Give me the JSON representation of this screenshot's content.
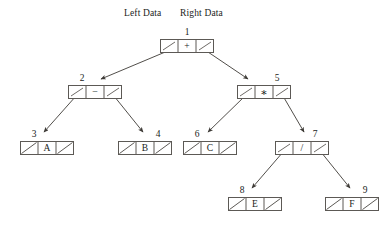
{
  "diagram": {
    "title_headers": [
      {
        "text": "Left Data",
        "x": 124,
        "y": 8
      },
      {
        "text": "Right Data",
        "x": 180,
        "y": 8
      }
    ],
    "node_width": 54,
    "node_height": 14,
    "nodes": [
      {
        "id": "node-1",
        "number": "1",
        "data": "+",
        "x": 160,
        "y": 39,
        "label_shift": "none",
        "left_null": false,
        "right_null": false,
        "kind": "operator"
      },
      {
        "id": "node-2",
        "number": "2",
        "data": "−",
        "x": 68,
        "y": 85,
        "label_shift": "left",
        "left_null": false,
        "right_null": false,
        "kind": "operator"
      },
      {
        "id": "node-5",
        "number": "5",
        "data": "∗",
        "x": 237,
        "y": 85,
        "label_shift": "right",
        "left_null": false,
        "right_null": false,
        "kind": "operator"
      },
      {
        "id": "node-3",
        "number": "3",
        "data": "A",
        "x": 20,
        "y": 141,
        "label_shift": "left",
        "left_null": true,
        "right_null": true,
        "kind": "leaf"
      },
      {
        "id": "node-4",
        "number": "4",
        "data": "B",
        "x": 118,
        "y": 141,
        "label_shift": "right",
        "left_null": true,
        "right_null": true,
        "kind": "leaf"
      },
      {
        "id": "node-6",
        "number": "6",
        "data": "C",
        "x": 183,
        "y": 141,
        "label_shift": "left",
        "left_null": true,
        "right_null": true,
        "kind": "leaf"
      },
      {
        "id": "node-7",
        "number": "7",
        "data": "/",
        "x": 275,
        "y": 141,
        "label_shift": "right",
        "left_null": false,
        "right_null": false,
        "kind": "operator"
      },
      {
        "id": "node-8",
        "number": "8",
        "data": "E",
        "x": 228,
        "y": 197,
        "label_shift": "left",
        "left_null": true,
        "right_null": true,
        "kind": "leaf"
      },
      {
        "id": "node-9",
        "number": "9",
        "data": "F",
        "x": 325,
        "y": 197,
        "label_shift": "right",
        "left_null": true,
        "right_null": true,
        "kind": "leaf"
      }
    ],
    "edges": [
      {
        "name": "edge-1-left-to-2",
        "from": "node-1",
        "side": "left",
        "x1": 170,
        "y1": 50,
        "x2": 101,
        "y2": 79
      },
      {
        "name": "edge-1-right-to-5",
        "from": "node-1",
        "side": "right",
        "x1": 205,
        "y1": 50,
        "x2": 248,
        "y2": 79
      },
      {
        "name": "edge-2-left-to-3",
        "from": "node-2",
        "side": "left",
        "x1": 76,
        "y1": 96,
        "x2": 44,
        "y2": 132
      },
      {
        "name": "edge-2-right-to-4",
        "from": "node-2",
        "side": "right",
        "x1": 114,
        "y1": 96,
        "x2": 143,
        "y2": 132
      },
      {
        "name": "edge-5-left-to-6",
        "from": "node-5",
        "side": "left",
        "x1": 245,
        "y1": 96,
        "x2": 208,
        "y2": 132
      },
      {
        "name": "edge-5-right-to-7",
        "from": "node-5",
        "side": "right",
        "x1": 283,
        "y1": 96,
        "x2": 304,
        "y2": 132
      },
      {
        "name": "edge-7-left-to-8",
        "from": "node-7",
        "side": "left",
        "x1": 283,
        "y1": 152,
        "x2": 252,
        "y2": 188
      },
      {
        "name": "edge-7-right-to-9",
        "from": "node-7",
        "side": "right",
        "x1": 321,
        "y1": 152,
        "x2": 350,
        "y2": 188
      }
    ],
    "colors": {
      "ink": "#201c1a",
      "box_stroke": "#5c5955",
      "edge_stroke": "#3d3a36",
      "background": "#ffffff"
    },
    "legend": {
      "structure": "binary expression tree",
      "cell_order": "left pointer, data, right pointer"
    }
  }
}
